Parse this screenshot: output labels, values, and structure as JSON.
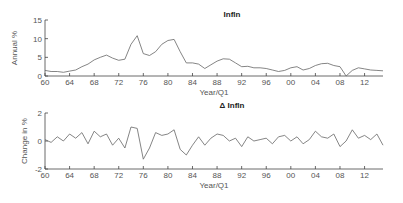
{
  "chart_data": [
    {
      "type": "line",
      "title": "Infln",
      "xlabel": "Year/Q1",
      "ylabel": "Annual %",
      "xlim": [
        1960,
        2015
      ],
      "ylim": [
        0,
        15
      ],
      "yticks": [
        0,
        5,
        10,
        15
      ],
      "xtick_labels": [
        "60",
        "64",
        "68",
        "72",
        "76",
        "80",
        "84",
        "88",
        "92",
        "96",
        "00",
        "04",
        "08",
        "12"
      ],
      "x": [
        1960,
        1961,
        1962,
        1963,
        1964,
        1965,
        1966,
        1967,
        1968,
        1969,
        1970,
        1971,
        1972,
        1973,
        1974,
        1975,
        1976,
        1977,
        1978,
        1979,
        1980,
        1981,
        1982,
        1983,
        1984,
        1985,
        1986,
        1987,
        1988,
        1989,
        1990,
        1991,
        1992,
        1993,
        1994,
        1995,
        1996,
        1997,
        1998,
        1999,
        2000,
        2001,
        2002,
        2003,
        2004,
        2005,
        2006,
        2007,
        2008,
        2009,
        2010,
        2011,
        2012,
        2013,
        2014,
        2015
      ],
      "values": [
        1.5,
        1.2,
        1.2,
        1.0,
        1.3,
        1.6,
        2.5,
        3.2,
        4.3,
        5.0,
        5.6,
        4.8,
        4.2,
        4.5,
        8.5,
        10.8,
        6.0,
        5.5,
        6.5,
        8.5,
        9.5,
        9.8,
        6.5,
        3.5,
        3.5,
        3.2,
        2.0,
        3.0,
        4.0,
        4.6,
        4.5,
        3.5,
        2.5,
        2.6,
        2.2,
        2.2,
        2.0,
        1.6,
        1.2,
        1.5,
        2.2,
        2.5,
        1.6,
        2.0,
        2.8,
        3.3,
        3.4,
        2.8,
        2.5,
        0.0,
        1.5,
        2.2,
        1.9,
        1.6,
        1.5,
        1.4
      ],
      "grid": false
    },
    {
      "type": "line",
      "title": "Δ Infln",
      "xlabel": "Year/Q1",
      "ylabel": "Change in %",
      "xlim": [
        1960,
        2015
      ],
      "ylim": [
        -2,
        2
      ],
      "yticks": [
        -2,
        0,
        2
      ],
      "xtick_labels": [
        "60",
        "64",
        "68",
        "72",
        "76",
        "80",
        "84",
        "88",
        "92",
        "96",
        "00",
        "04",
        "08",
        "12"
      ],
      "x": [
        1960,
        1961,
        1962,
        1963,
        1964,
        1965,
        1966,
        1967,
        1968,
        1969,
        1970,
        1971,
        1972,
        1973,
        1974,
        1975,
        1976,
        1977,
        1978,
        1979,
        1980,
        1981,
        1982,
        1983,
        1984,
        1985,
        1986,
        1987,
        1988,
        1989,
        1990,
        1991,
        1992,
        1993,
        1994,
        1995,
        1996,
        1997,
        1998,
        1999,
        2000,
        2001,
        2002,
        2003,
        2004,
        2005,
        2006,
        2007,
        2008,
        2009,
        2010,
        2011,
        2012,
        2013,
        2014,
        2015
      ],
      "values": [
        0.1,
        -0.1,
        0.3,
        0.0,
        0.5,
        0.2,
        0.6,
        -0.2,
        0.7,
        0.3,
        0.5,
        -0.3,
        0.2,
        -0.5,
        1.0,
        0.9,
        -1.3,
        -0.5,
        0.6,
        0.4,
        0.5,
        0.8,
        -0.6,
        -1.0,
        -0.3,
        0.3,
        -0.3,
        0.2,
        0.5,
        0.4,
        0.0,
        0.2,
        -0.4,
        0.3,
        0.0,
        0.1,
        0.2,
        -0.2,
        0.3,
        0.4,
        0.0,
        0.3,
        -0.2,
        0.1,
        0.7,
        0.3,
        0.2,
        0.5,
        -0.4,
        0.0,
        0.8,
        0.2,
        0.4,
        0.1,
        0.5,
        -0.3
      ],
      "grid": false
    }
  ]
}
